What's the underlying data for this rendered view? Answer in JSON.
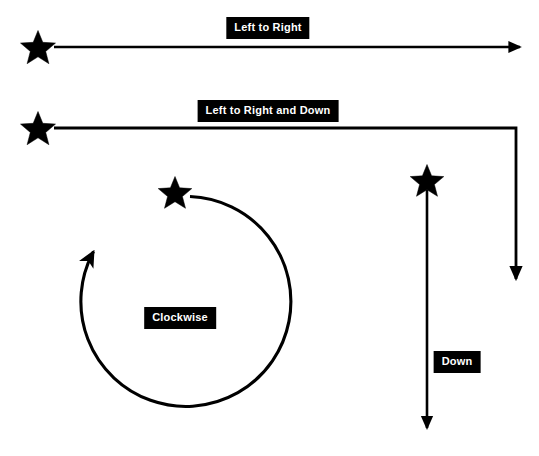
{
  "diagram": {
    "background_color": "#ffffff",
    "stroke_color": "#000000",
    "label_background_color": "#000000",
    "label_text_color": "#ffffff",
    "width": 539,
    "height": 456
  },
  "labels": {
    "left_to_right": "Left to Right",
    "left_to_right_and_down": "Left to Right and Down",
    "clockwise": "Clockwise",
    "down": "Down"
  },
  "paths": [
    {
      "id": "left-to-right",
      "label": "Left to Right",
      "shape": "straight-horizontal",
      "start_marker": "star",
      "end_marker": "arrowhead",
      "start": {
        "x": 38,
        "y": 47
      },
      "end": {
        "x": 523,
        "y": 47
      }
    },
    {
      "id": "left-to-right-and-down",
      "label": "Left to Right and Down",
      "shape": "elbow-right-then-down",
      "start_marker": "star",
      "end_marker": "arrowhead",
      "start": {
        "x": 38,
        "y": 128
      },
      "corner": {
        "x": 516,
        "y": 128
      },
      "end": {
        "x": 516,
        "y": 283
      }
    },
    {
      "id": "clockwise",
      "label": "Clockwise",
      "shape": "circular-arc",
      "start_marker": "star",
      "end_marker": "arrowhead",
      "direction": "clockwise",
      "center": {
        "x": 180,
        "y": 312
      },
      "radius": 105,
      "start": {
        "x": 180,
        "y": 207
      },
      "end": {
        "x": 97,
        "y": 243
      }
    },
    {
      "id": "down",
      "label": "Down",
      "shape": "straight-vertical",
      "start_marker": "star",
      "end_marker": "arrowhead",
      "start": {
        "x": 427,
        "y": 180
      },
      "end": {
        "x": 427,
        "y": 432
      }
    }
  ],
  "stars": [
    {
      "id": "star-left-to-right",
      "x": 38,
      "y": 47,
      "size": 20
    },
    {
      "id": "star-left-to-right-and-down",
      "x": 38,
      "y": 128,
      "size": 20
    },
    {
      "id": "star-clockwise",
      "x": 175,
      "y": 192,
      "size": 19
    },
    {
      "id": "star-down",
      "x": 427,
      "y": 180,
      "size": 19
    }
  ]
}
